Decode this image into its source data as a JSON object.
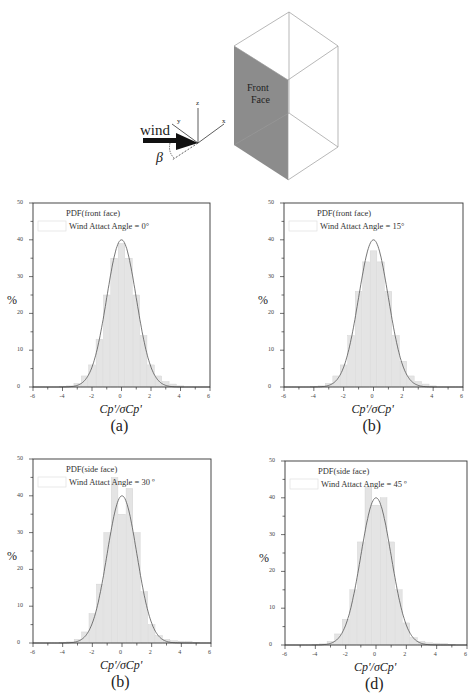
{
  "diagram": {
    "wind_label": "wind",
    "beta_label": "β",
    "axis_x": "x",
    "axis_y": "y",
    "axis_z": "z",
    "face_label_line1": "Front",
    "face_label_line2": "Face",
    "face_color": "#8c8c8c"
  },
  "chart_data": [
    {
      "id": "a",
      "type": "bar",
      "title": "",
      "caption": "(a)",
      "legend": [
        "PDF(front face)",
        "Wind Attact Angle = 0°"
      ],
      "xlabel": "Cp'/σCp'",
      "ylabel": "%",
      "xlim": [
        -6,
        6
      ],
      "ylim": [
        0,
        50
      ],
      "xticks": [
        "-6",
        "-4",
        "-2",
        "0",
        "2",
        "4",
        "6"
      ],
      "yticks": [
        "0",
        "10",
        "20",
        "30",
        "40",
        "50"
      ],
      "series": [
        {
          "name": "Histogram",
          "x": [
            -4,
            -3.5,
            -3,
            -2.5,
            -2,
            -1.5,
            -1,
            -0.5,
            0,
            0.5,
            1,
            1.5,
            2,
            2.5,
            3,
            3.5,
            4
          ],
          "values": [
            0.1,
            0.3,
            1,
            3,
            6,
            13,
            25,
            35,
            39,
            35,
            25,
            14,
            6,
            3,
            1.5,
            0.8,
            0.3
          ]
        },
        {
          "name": "Gaussian fit",
          "type": "line",
          "mean": 0,
          "sigma": 1,
          "peak": 40
        }
      ]
    },
    {
      "id": "b",
      "type": "bar",
      "caption": "(b)",
      "legend": [
        "PDF(front face)",
        "Wind Attact Angle = 15°"
      ],
      "xlabel": "Cp'/σCp'",
      "ylabel": "%",
      "xlim": [
        -6,
        6
      ],
      "ylim": [
        0,
        50
      ],
      "xticks": [
        "-6",
        "-4",
        "-2",
        "0",
        "2",
        "4",
        "6"
      ],
      "yticks": [
        "0",
        "10",
        "20",
        "30",
        "40",
        "50"
      ],
      "series": [
        {
          "name": "Histogram",
          "x": [
            -4,
            -3.5,
            -3,
            -2.5,
            -2,
            -1.5,
            -1,
            -0.5,
            0,
            0.5,
            1,
            1.5,
            2,
            2.5,
            3,
            3.5,
            4
          ],
          "values": [
            0.1,
            0.3,
            1,
            3,
            6,
            14,
            26,
            34,
            37,
            34,
            26,
            14,
            7,
            3,
            1.5,
            0.8,
            0.3
          ]
        },
        {
          "name": "Gaussian fit",
          "type": "line",
          "mean": 0,
          "sigma": 1,
          "peak": 40
        }
      ]
    },
    {
      "id": "c",
      "type": "bar",
      "caption": "(b)",
      "legend": [
        "PDF(side face)",
        "Wind Attact Angle = 30 º"
      ],
      "xlabel": "Cp'/σCp'",
      "ylabel": "%",
      "xlim": [
        -6,
        6
      ],
      "ylim": [
        0,
        50
      ],
      "xticks": [
        "-6",
        "-4",
        "-2",
        "0",
        "2",
        "4",
        "6"
      ],
      "yticks": [
        "0",
        "10",
        "20",
        "30",
        "40",
        "50"
      ],
      "series": [
        {
          "name": "Histogram",
          "x": [
            -4,
            -3.5,
            -3,
            -2.5,
            -2,
            -1.5,
            -1,
            -0.5,
            0,
            0.5,
            1,
            1.5,
            2,
            2.5,
            3,
            3.5,
            4,
            4.5,
            5
          ],
          "values": [
            0.1,
            0.3,
            1,
            3,
            8,
            16,
            30,
            45,
            35,
            42,
            30,
            14,
            5,
            2,
            1,
            0.6,
            0.5,
            0.5,
            0.2
          ]
        },
        {
          "name": "Gaussian fit",
          "type": "line",
          "mean": 0,
          "sigma": 1,
          "peak": 40
        }
      ]
    },
    {
      "id": "d",
      "type": "bar",
      "caption": "(d)",
      "legend": [
        "PDF(side face)",
        "Wind Attact Angle = 45 º"
      ],
      "xlabel": "Cp'/σCp'",
      "ylabel": "%",
      "xlim": [
        -6,
        6
      ],
      "ylim": [
        0,
        50
      ],
      "xticks": [
        "-6",
        "-4",
        "-2",
        "0",
        "2",
        "4",
        "6"
      ],
      "yticks": [
        "0",
        "10",
        "20",
        "30",
        "40",
        "50"
      ],
      "series": [
        {
          "name": "Histogram",
          "x": [
            -4,
            -3.5,
            -3,
            -2.5,
            -2,
            -1.5,
            -1,
            -0.5,
            0,
            0.5,
            1,
            1.5,
            2,
            2.5,
            3,
            3.5,
            4,
            4.5,
            5
          ],
          "values": [
            0.1,
            0.3,
            1,
            3,
            7,
            15,
            28,
            43,
            38,
            40,
            28,
            15,
            6,
            2,
            1,
            0.6,
            0.5,
            0.4,
            0.2
          ]
        },
        {
          "name": "Gaussian fit",
          "type": "line",
          "mean": 0,
          "sigma": 1,
          "peak": 40
        }
      ]
    }
  ]
}
